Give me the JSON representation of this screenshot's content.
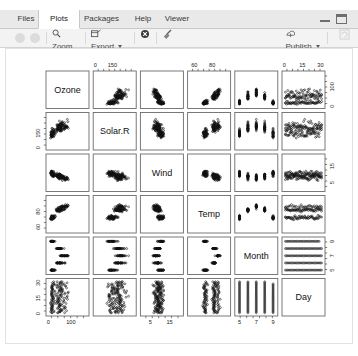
{
  "window": {
    "title_tabs": [
      "Files",
      "Plots",
      "Packages",
      "Help",
      "Viewer"
    ],
    "active_tab": "Plots",
    "minimize_label": "Minimize",
    "maximize_label": "Maximize"
  },
  "toolbar": {
    "back_label": "Previous Plot",
    "forward_label": "Next Plot",
    "zoom_label": "Zoom",
    "export_label": "Export",
    "remove_label": "Remove current plot",
    "clear_label": "Clear all plots",
    "publish_label": "Publish",
    "refresh_label": "Refresh current plot"
  },
  "chart_data": {
    "type": "scatter",
    "title": "",
    "variant": "scatterplot-matrix",
    "variables": [
      "Ozone",
      "Solar.R",
      "Wind",
      "Temp",
      "Month",
      "Day"
    ],
    "axis_ticks": {
      "Ozone": {
        "labels": [
          "0",
          "100"
        ],
        "values": [
          0,
          100
        ],
        "range": [
          0,
          170
        ]
      },
      "Solar.R": {
        "labels": [
          "0",
          "150"
        ],
        "values": [
          0,
          150
        ],
        "range": [
          0,
          340
        ]
      },
      "Wind": {
        "labels": [
          "5",
          "15"
        ],
        "values": [
          5,
          15
        ],
        "range": [
          1,
          21
        ]
      },
      "Temp": {
        "labels": [
          "60",
          "80"
        ],
        "values": [
          60,
          80
        ],
        "range": [
          55,
          98
        ]
      },
      "Month": {
        "labels": [
          "5",
          "7",
          "9"
        ],
        "values": [
          5,
          7,
          9
        ],
        "range": [
          4.7,
          9.3
        ]
      },
      "Day": {
        "labels": [
          "0",
          "15",
          "30"
        ],
        "values": [
          0,
          15,
          30
        ],
        "range": [
          0,
          32
        ]
      }
    },
    "top_axis_vars": [
      "Solar.R",
      "Temp",
      "Day"
    ],
    "bottom_axis_vars": [
      "Ozone",
      "Wind",
      "Month"
    ],
    "left_axis_vars": [
      "Solar.R",
      "Temp",
      "Day"
    ],
    "right_axis_vars": [
      "Ozone",
      "Wind",
      "Month"
    ],
    "n_observations": 153,
    "dataset_name": "airquality",
    "grid": false,
    "legend": "none",
    "point_symbol": "open-circle",
    "point_color": "#111111"
  }
}
